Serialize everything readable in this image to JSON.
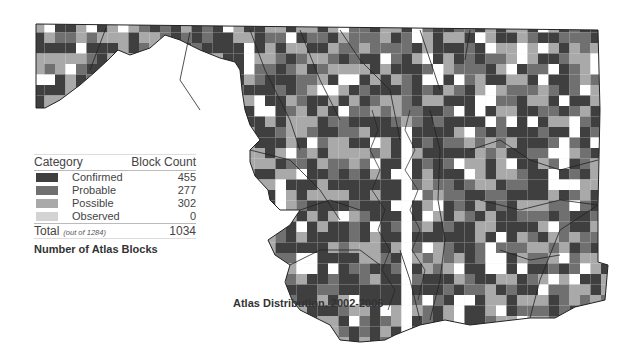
{
  "legend": {
    "header_category": "Category",
    "header_count": "Block Count",
    "items": [
      {
        "label": "Confirmed",
        "count": "455",
        "color": "#3f3f3f"
      },
      {
        "label": "Probable",
        "count": "277",
        "color": "#707070"
      },
      {
        "label": "Possible",
        "count": "302",
        "color": "#a9a9a9"
      },
      {
        "label": "Observed",
        "count": "0",
        "color": "#d3d3d3"
      }
    ],
    "total_label": "Total",
    "total_sub": "(out of 1284)",
    "total_count": "1034"
  },
  "captions": {
    "legend_title": "Number of Atlas Blocks",
    "map_title": "Atlas Distribution, 2002-2006"
  },
  "map": {
    "region": "Maryland",
    "grid_color": "#dddddd",
    "border_color": "#222222"
  }
}
